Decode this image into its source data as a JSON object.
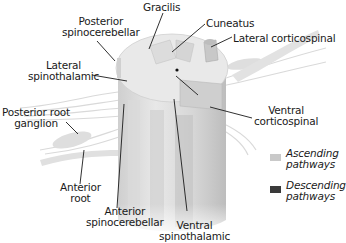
{
  "diagram": {
    "labels": {
      "posterior_spinocerebellar": "Posterior spinocerebellar",
      "posterior_spinocerebellar_l1": "Posterior",
      "posterior_spinocerebellar_l2": "spinocerebellar",
      "gracilis": "Gracilis",
      "cuneatus": "Cuneatus",
      "lateral_corticospinal": "Lateral corticospinal",
      "lateral_spinothalamic_l1": "Lateral",
      "lateral_spinothalamic_l2": "spinothalamic",
      "posterior_root_ganglion_l1": "Posterior root",
      "posterior_root_ganglion_l2": "ganglion",
      "ventral_corticospinal_l1": "Ventral",
      "ventral_corticospinal_l2": "corticospinal",
      "anterior_root_l1": "Anterior",
      "anterior_root_l2": "root",
      "anterior_spinocerebellar_l1": "Anterior",
      "anterior_spinocerebellar_l2": "spinocerebellar",
      "ventral_spinothalamic_l1": "Ventral",
      "ventral_spinothalamic_l2": "spinothalamic"
    },
    "legend": [
      {
        "label_l1": "Ascending",
        "label_l2": "pathways",
        "color": "#c9c9c9"
      },
      {
        "label_l1": "Descending",
        "label_l2": "pathways",
        "color": "#3a3a3a"
      }
    ],
    "colors": {
      "cord_light": "#e6e6e6",
      "cord_mid": "#d2d2d2",
      "cord_dark": "#b5b5b5",
      "nerve": "#dcdcdc",
      "leader_line": "#1a1a1a"
    }
  }
}
